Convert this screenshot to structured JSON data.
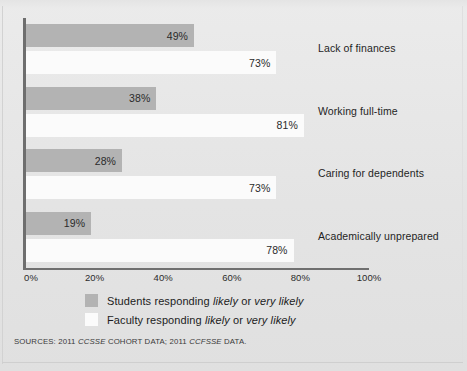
{
  "chart_data": {
    "type": "bar",
    "orientation": "horizontal",
    "title": "",
    "subtitle": "",
    "xlabel": "",
    "ylabel": "",
    "xlim": [
      0,
      100
    ],
    "xticks": [
      "0%",
      "20%",
      "40%",
      "60%",
      "80%",
      "100%"
    ],
    "xtick_values": [
      0,
      20,
      40,
      60,
      80,
      100
    ],
    "grid": false,
    "legend_position": "bottom",
    "categories": [
      "Lack of finances",
      "Working full-time",
      "Caring for dependents",
      "Academically unprepared"
    ],
    "series": [
      {
        "name": "Students responding likely or very likely",
        "color": "#b3b3b3",
        "values": [
          49,
          38,
          28,
          19
        ],
        "labels": [
          "49%",
          "38%",
          "28%",
          "19%"
        ]
      },
      {
        "name": "Faculty responding likely or very likely",
        "color": "#fbfbfb",
        "values": [
          73,
          81,
          73,
          78
        ],
        "labels": [
          "73%",
          "81%",
          "73%",
          "78%"
        ]
      }
    ]
  },
  "legend": {
    "items": [
      {
        "swatch": "students",
        "prefix": "Students responding ",
        "em1": "likely",
        "middle": " or ",
        "em2": "very likely",
        "suffix": ""
      },
      {
        "swatch": "faculty",
        "prefix": "Faculty responding ",
        "em1": "likely",
        "middle": " or ",
        "em2": "very likely",
        "suffix": ""
      }
    ]
  },
  "sources": {
    "prefix": "SOURCES: 2011 ",
    "em1": "CCSSE",
    "middle": " COHORT DATA;  2011 ",
    "em2": "CCFSSE",
    "suffix": " DATA."
  },
  "colors": {
    "students_bar": "#b3b3b3",
    "faculty_bar": "#fbfbfb",
    "axis": "#6e6e6e",
    "panel_bg": "#e7e7e7",
    "text": "#1f1f1f"
  }
}
